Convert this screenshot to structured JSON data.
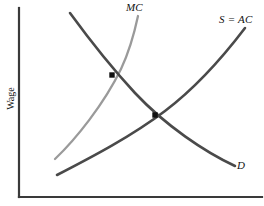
{
  "figure": {
    "type": "economics-diagram",
    "background_color": "#ffffff"
  },
  "axes": {
    "y_axis_label": "Wage",
    "x_axis_label": "",
    "axis_color": "#3a3a3a",
    "origin": {
      "x": 19,
      "y": 197
    },
    "y_top": {
      "x": 19,
      "y": 8
    },
    "x_right": {
      "x": 262,
      "y": 197
    }
  },
  "labels": {
    "mc": "MC",
    "s_ac": "S = AC",
    "d": "D"
  },
  "colors": {
    "mc_curve": "#9a9a9a",
    "supply_curve": "#4a4a4a",
    "demand_curve": "#4a4a4a",
    "marker": "#111111",
    "axis": "#3a3a3a"
  },
  "chart_data": {
    "type": "line",
    "title": "",
    "xlabel": "",
    "ylabel": "Wage",
    "grid": false,
    "legend": "inline-curve-labels",
    "xlim": [
      19,
      262
    ],
    "ylim": [
      197,
      8
    ],
    "series": [
      {
        "name": "MC",
        "label": "MC",
        "color": "#9a9a9a",
        "description": "Marginal cost of labor curve, upward sloping and steep",
        "path": "M 55 159 C 76 139, 104 104, 121 69 C 130 50, 135 30, 138 16",
        "points": [
          [
            55,
            159
          ],
          [
            75,
            138
          ],
          [
            95,
            112
          ],
          [
            112,
            86
          ],
          [
            126,
            57
          ],
          [
            134,
            34
          ],
          [
            138,
            16
          ]
        ]
      },
      {
        "name": "S = AC",
        "label": "S = AC",
        "color": "#4a4a4a",
        "description": "Labor supply curve equal to average cost, upward sloping",
        "path": "M 57 175 C 92 157, 132 136, 165 111 C 198 86, 226 53, 245 28",
        "points": [
          [
            57,
            175
          ],
          [
            90,
            158
          ],
          [
            120,
            141
          ],
          [
            155,
            115
          ],
          [
            190,
            87
          ],
          [
            220,
            56
          ],
          [
            245,
            28
          ]
        ]
      },
      {
        "name": "D",
        "label": "D",
        "color": "#4a4a4a",
        "description": "Labor demand curve (marginal revenue product), downward sloping",
        "path": "M 70 13 C 89 39, 110 66, 135 93 C 166 126, 205 152, 235 166",
        "points": [
          [
            70,
            13
          ],
          [
            92,
            43
          ],
          [
            112,
            75
          ],
          [
            135,
            93
          ],
          [
            170,
            127
          ],
          [
            205,
            152
          ],
          [
            235,
            166
          ]
        ]
      }
    ],
    "markers": [
      {
        "name": "mc-demand-intersection",
        "x": 112,
        "y": 75,
        "label": "",
        "shape": "square",
        "color": "#111111",
        "description": "Intersection of MC and D (monopsony hiring level)"
      },
      {
        "name": "supply-demand-intersection",
        "x": 155,
        "y": 115,
        "label": "",
        "shape": "square",
        "color": "#111111",
        "description": "Intersection of S = AC and D (competitive equilibrium)"
      }
    ]
  }
}
